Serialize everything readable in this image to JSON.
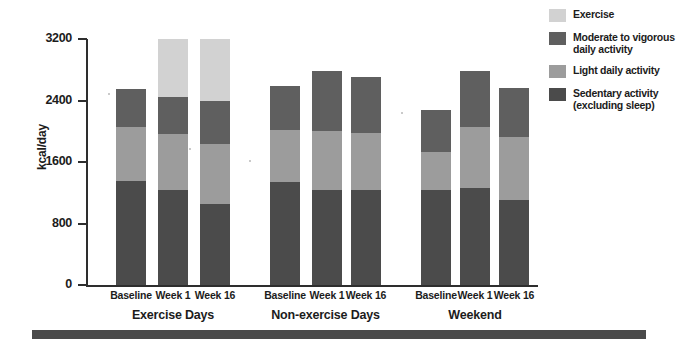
{
  "chart_data": {
    "type": "bar",
    "stacked": true,
    "title": "",
    "xlabel": "",
    "ylabel": "kcal/day",
    "ylim": [
      0,
      3200
    ],
    "yticks": [
      0,
      800,
      1600,
      2400,
      3200
    ],
    "ytick_labels": [
      "0",
      "800",
      "1600",
      "2400",
      "3200"
    ],
    "grid": false,
    "legend_position": "right",
    "categories": [
      "Baseline",
      "Week 1",
      "Week 16",
      "Baseline",
      "Week 1",
      "Week 16",
      "Baseline",
      "Week 1",
      "Week 16"
    ],
    "groups": [
      {
        "name": "Exercise Days",
        "categories": [
          "Baseline",
          "Week 1",
          "Week 16"
        ],
        "totals": [
          2550,
          3200,
          3200
        ]
      },
      {
        "name": "Non-exercise Days",
        "categories": [
          "Baseline",
          "Week 1",
          "Week 16"
        ],
        "totals": [
          2590,
          2790,
          2700
        ]
      },
      {
        "name": "Weekend",
        "categories": [
          "Baseline",
          "Week 1",
          "Week 16"
        ],
        "totals": [
          2275,
          2790,
          2560
        ]
      }
    ],
    "series": [
      {
        "name": "Sedentary activity (excluding sleep)",
        "color": "#4b4b4b",
        "values": [
          1350,
          1230,
          1060,
          1340,
          1230,
          1230,
          1230,
          1260,
          1100
        ]
      },
      {
        "name": "Light daily activity",
        "color": "#9c9c9c",
        "values": [
          700,
          740,
          780,
          680,
          780,
          750,
          500,
          800,
          820
        ]
      },
      {
        "name": "Moderate to vigorous daily activity",
        "color": "#5f5f5f",
        "values": [
          500,
          480,
          560,
          570,
          780,
          720,
          545,
          730,
          640
        ]
      },
      {
        "name": "Exercise",
        "color": "#d2d2d2",
        "values": [
          0,
          750,
          800,
          0,
          0,
          0,
          0,
          0,
          0
        ]
      }
    ]
  },
  "axes": {
    "y_title": "kcal/day",
    "y_ticks": [
      {
        "label": "3200",
        "value": 3200
      },
      {
        "label": "2400",
        "value": 2400
      },
      {
        "label": "1600",
        "value": 1600
      },
      {
        "label": "800",
        "value": 800
      },
      {
        "label": "0",
        "value": 0
      }
    ]
  },
  "legend": {
    "items": [
      {
        "label": "Exercise",
        "color": "#d2d2d2"
      },
      {
        "label": "Moderate to vigorous\ndaily activity",
        "color": "#5f5f5f"
      },
      {
        "label": "Light daily activity",
        "color": "#9c9c9c"
      },
      {
        "label": "Sedentary activity\n(excluding sleep)",
        "color": "#4b4b4b"
      }
    ]
  },
  "colors": {
    "exercise": "#d2d2d2",
    "moderate_vigorous": "#5f5f5f",
    "light": "#9c9c9c",
    "sedentary": "#4b4b4b",
    "axis": "#2e2e2e",
    "rule": "#4a4a4a",
    "background": "#ffffff"
  }
}
